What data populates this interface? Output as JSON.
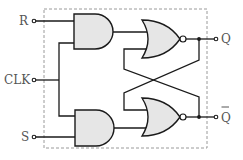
{
  "diagram": {
    "inputs": {
      "r_label": "R",
      "clk_label": "CLK",
      "s_label": "S"
    },
    "outputs": {
      "q_label": "Q",
      "qbar_label": "Q",
      "qbar_overline": true
    },
    "components": [
      {
        "id": "and-top",
        "type": "AND",
        "inputs": [
          "R",
          "CLK"
        ],
        "output": "nor-top"
      },
      {
        "id": "and-bottom",
        "type": "AND",
        "inputs": [
          "CLK",
          "S"
        ],
        "output": "nor-bottom"
      },
      {
        "id": "nor-top",
        "type": "NOR",
        "inputs": [
          "and-top",
          "Q-bar feedback"
        ],
        "output": "Q"
      },
      {
        "id": "nor-bottom",
        "type": "NOR",
        "inputs": [
          "Q feedback",
          "and-bottom"
        ],
        "output": "Q-bar"
      }
    ],
    "colors": {
      "gate_fill": "#e6e6e6",
      "stroke": "#1a1a1a",
      "label": "#555555",
      "border": "#9a9a9a"
    }
  }
}
